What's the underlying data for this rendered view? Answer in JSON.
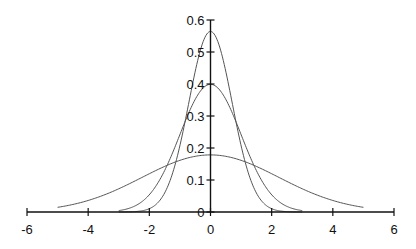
{
  "chart_data": {
    "type": "line",
    "title": "",
    "xlabel": "",
    "ylabel": "",
    "xlim": [
      -6,
      6
    ],
    "ylim": [
      0,
      0.6
    ],
    "grid": false,
    "legend": null,
    "x_ticks": [
      "-6",
      "-4",
      "-2",
      "0",
      "2",
      "4",
      "6"
    ],
    "y_ticks": [
      "0",
      "0.1",
      "0.2",
      "0.3",
      "0.4",
      "0.5",
      "0.6"
    ],
    "series": [
      {
        "name": "Normal density (sigma = 0.707)",
        "mean": 0,
        "sd": 0.7071,
        "x_range": [
          -3,
          3
        ],
        "peak": 0.564,
        "x": [
          -3,
          -2.5,
          -2,
          -1.5,
          -1,
          -0.75,
          -0.5,
          -0.25,
          0,
          0.25,
          0.5,
          0.75,
          1,
          1.5,
          2,
          2.5,
          3
        ],
        "values": [
          0.0001,
          0.001,
          0.01,
          0.059,
          0.208,
          0.322,
          0.439,
          0.529,
          0.564,
          0.529,
          0.439,
          0.322,
          0.208,
          0.059,
          0.01,
          0.001,
          0.0001
        ]
      },
      {
        "name": "Normal density (sigma = 1)",
        "mean": 0,
        "sd": 1,
        "x_range": [
          -3,
          3
        ],
        "peak": 0.399,
        "x": [
          -3,
          -2.5,
          -2,
          -1.5,
          -1,
          -0.5,
          0,
          0.5,
          1,
          1.5,
          2,
          2.5,
          3
        ],
        "values": [
          0.004,
          0.018,
          0.054,
          0.13,
          0.242,
          0.352,
          0.399,
          0.352,
          0.242,
          0.13,
          0.054,
          0.018,
          0.004
        ]
      },
      {
        "name": "Normal density (sigma = 2.236)",
        "mean": 0,
        "sd": 2.236,
        "x_range": [
          -5,
          5
        ],
        "peak": 0.178,
        "x": [
          -5,
          -4,
          -3,
          -2,
          -1,
          0,
          1,
          2,
          3,
          4,
          5
        ],
        "values": [
          0.015,
          0.036,
          0.072,
          0.12,
          0.161,
          0.178,
          0.161,
          0.12,
          0.072,
          0.036,
          0.015
        ]
      }
    ]
  },
  "layout": {
    "x_pixel_min": 27,
    "x_pixel_max": 394,
    "y_pixel_zero": 212,
    "y_pixel_per_unit": 320,
    "line_color": "#555555",
    "axis_color": "#111111"
  }
}
